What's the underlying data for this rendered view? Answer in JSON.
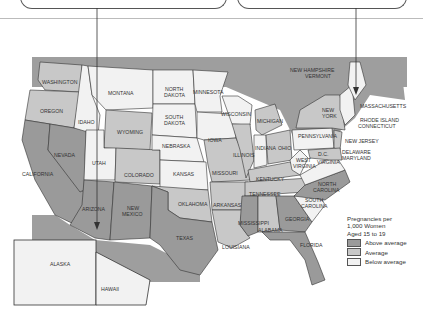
{
  "legend": {
    "title_lines": [
      "Pregnancies per",
      "1,000 Women",
      "Aged 15 to 19"
    ],
    "items": [
      {
        "label": "Above average",
        "color": "#9a9a9a"
      },
      {
        "label": "Average",
        "color": "#c8c8c8"
      },
      {
        "label": "Below average",
        "color": "#f2f2f2"
      }
    ]
  },
  "colors": {
    "canada_ocean": "#9e9e9e",
    "water": "#f4f4f4",
    "border": "#333333"
  },
  "states": {
    "washington": "WASHINGTON",
    "oregon": "OREGON",
    "idaho": "IDAHO",
    "montana": "MONTANA",
    "north_dakota_1": "NORTH",
    "north_dakota_2": "DAKOTA",
    "south_dakota_1": "SOUTH",
    "south_dakota_2": "DAKOTA",
    "minnesota": "MINNESOTA",
    "wisconsin": "WISCONSIN",
    "michigan": "MICHIGAN",
    "wyoming": "WYOMING",
    "nebraska": "NEBRASKA",
    "iowa": "IOWA",
    "illinois": "ILLINOIS",
    "indiana": "INDIANA",
    "ohio": "OHIO",
    "pennsylvania": "PENNSYLVANIA",
    "new_york_1": "NEW",
    "new_york_2": "YORK",
    "nevada": "NEVADA",
    "utah": "UTAH",
    "colorado": "COLORADO",
    "kansas": "KANSAS",
    "missouri": "MISSOURI",
    "kentucky": "KENTUCKY",
    "west_virginia_1": "WEST",
    "west_virginia_2": "VIRGINIA",
    "virginia": "VIRGINIA",
    "dc": "D.C.",
    "california": "CALIFORNIA",
    "arizona": "ARIZONA",
    "new_mexico_1": "NEW",
    "new_mexico_2": "MEXICO",
    "oklahoma": "OKLAHOMA",
    "arkansas": "ARKANSAS",
    "tennessee": "TENNESSEE",
    "north_carolina_1": "NORTH",
    "north_carolina_2": "CAROLINA",
    "south_carolina_1": "SOUTH",
    "south_carolina_2": "CAROLINA",
    "texas": "TEXAS",
    "louisiana": "LOUISIANA",
    "mississippi": "MISSISSIPPI",
    "alabama": "ALABAMA",
    "georgia": "GEORGIA",
    "florida": "FLORIDA",
    "alaska": "ALASKA",
    "hawaii": "HAWAII",
    "maine": "MAINE"
  },
  "callout_labels": {
    "nh_vt_1": "NEW HAMPSHIRE",
    "nh_vt_2": "VERMONT",
    "massachusetts": "MASSACHUSETTS",
    "ri_ct_1": "RHODE ISLAND",
    "ri_ct_2": "CONNECTICUT",
    "new_jersey": "NEW JERSEY",
    "de_md_1": "DELAWARE",
    "de_md_2": "MARYLAND"
  }
}
